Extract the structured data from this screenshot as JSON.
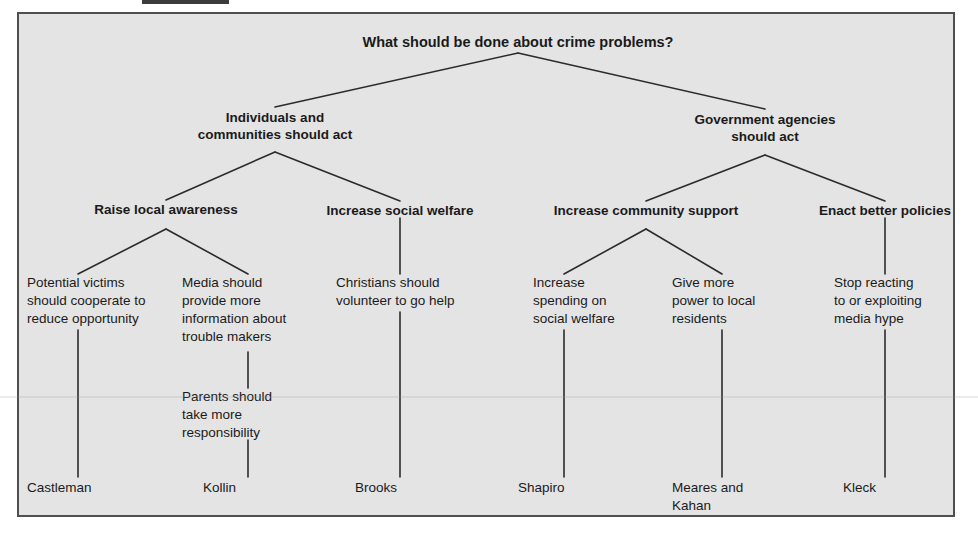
{
  "figure": {
    "background_color": "#e4e4e4",
    "border_color": "#4f4f4f",
    "line_color": "#2b2b2b",
    "text_color": "#1a1a1a"
  },
  "diagram": {
    "type": "tree",
    "root": {
      "id": "root",
      "label": "What should be done about crime problems?"
    },
    "level2": [
      {
        "id": "individuals",
        "label": "Individuals and\ncommunities should act"
      },
      {
        "id": "government",
        "label": "Government agencies\nshould act"
      }
    ],
    "level3": [
      {
        "id": "awareness",
        "label": "Raise local awareness",
        "parent": "individuals"
      },
      {
        "id": "welfare",
        "label": "Increase social welfare",
        "parent": "individuals"
      },
      {
        "id": "community",
        "label": "Increase community support",
        "parent": "government"
      },
      {
        "id": "policies",
        "label": "Enact better policies",
        "parent": "government"
      }
    ],
    "claims": [
      {
        "id": "claim-victims",
        "label": "Potential victims\nshould cooperate to\nreduce opportunity",
        "parent": "awareness"
      },
      {
        "id": "claim-media",
        "label": "Media should\nprovide more\ninformation about\ntrouble makers",
        "parent": "awareness"
      },
      {
        "id": "claim-christians",
        "label": "Christians should\nvolunteer to go help",
        "parent": "welfare"
      },
      {
        "id": "claim-spending",
        "label": "Increase\nspending on\nsocial welfare",
        "parent": "community"
      },
      {
        "id": "claim-power",
        "label": "Give more\npower to local\nresidents",
        "parent": "community"
      },
      {
        "id": "claim-hype",
        "label": "Stop reacting\nto or exploiting\nmedia hype",
        "parent": "policies"
      }
    ],
    "subclaims": [
      {
        "id": "claim-parents",
        "label": "Parents should\ntake more\nresponsibility",
        "parent": "claim-media"
      }
    ],
    "sources": [
      {
        "id": "source-castleman",
        "label": "Castleman",
        "parent": "claim-victims"
      },
      {
        "id": "source-kollin",
        "label": "Kollin",
        "parent": "claim-parents"
      },
      {
        "id": "source-brooks",
        "label": "Brooks",
        "parent": "claim-christians"
      },
      {
        "id": "source-shapiro",
        "label": "Shapiro",
        "parent": "claim-spending"
      },
      {
        "id": "source-meares",
        "label": "Meares and\nKahan",
        "parent": "claim-power"
      },
      {
        "id": "source-kleck",
        "label": "Kleck",
        "parent": "claim-hype"
      }
    ]
  }
}
